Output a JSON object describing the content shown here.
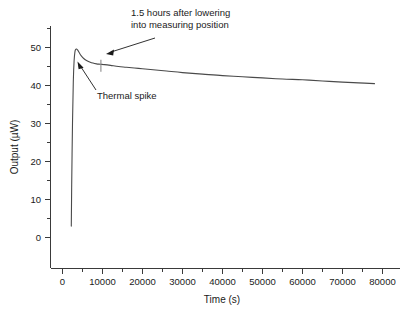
{
  "chart_data": {
    "type": "line",
    "title": "",
    "xlabel": "Time (s)",
    "ylabel": "Output (µW)",
    "xlim": [
      -4000,
      85000
    ],
    "ylim": [
      -3,
      56
    ],
    "xticks": [
      0,
      10000,
      20000,
      30000,
      40000,
      50000,
      60000,
      70000,
      80000
    ],
    "xticklabels": [
      "0",
      "10000",
      "20000",
      "30000",
      "40000",
      "50000",
      "60000",
      "70000",
      "80000"
    ],
    "yticks": [
      0,
      10,
      20,
      30,
      40,
      50
    ],
    "yticklabels": [
      "0",
      "10",
      "20",
      "30",
      "40",
      "50"
    ],
    "minor_ticks": true,
    "grid": false,
    "legend": false,
    "series": [
      {
        "name": "Output",
        "color": "#4a4a4a",
        "x": [
          2200,
          2300,
          2500,
          2700,
          2900,
          3100,
          3300,
          3500,
          3800,
          4200,
          4700,
          5300,
          6000,
          6800,
          7600,
          8500,
          9400,
          10500,
          12000,
          14000,
          16000,
          19000,
          22000,
          26000,
          30000,
          35000,
          40000,
          45000,
          50000,
          55000,
          60000,
          65000,
          70000,
          74000,
          78000
        ],
        "y": [
          3.0,
          14.0,
          30.0,
          41.0,
          46.5,
          48.8,
          49.5,
          49.6,
          49.3,
          48.6,
          47.8,
          47.1,
          46.6,
          46.2,
          45.9,
          45.7,
          45.6,
          45.5,
          45.3,
          45.0,
          44.8,
          44.5,
          44.2,
          43.8,
          43.4,
          43.0,
          42.6,
          42.3,
          42.0,
          41.7,
          41.5,
          41.2,
          40.9,
          40.7,
          40.5
        ]
      }
    ],
    "markers": [
      {
        "name": "measuring-position-marker",
        "x": 9600,
        "y_top": 46.8,
        "y_bottom": 43.6,
        "color": "#8a8a8a"
      }
    ],
    "annotations": [
      {
        "name": "measuring-position-annotation",
        "lines": [
          "1.5 hours after lowering",
          "into measuring position"
        ],
        "text_x": 131,
        "text_y": 16,
        "leader_from_x": 155,
        "leader_from_y": 38,
        "leader_to_x": 106,
        "leader_to_y": 54
      },
      {
        "name": "thermal-spike-annotation",
        "lines": [
          "Thermal spike"
        ],
        "text_x": 97,
        "text_y": 96,
        "leader_from_x": 96,
        "leader_from_y": 88,
        "leader_to_x": 78,
        "leader_to_y": 62
      }
    ]
  }
}
